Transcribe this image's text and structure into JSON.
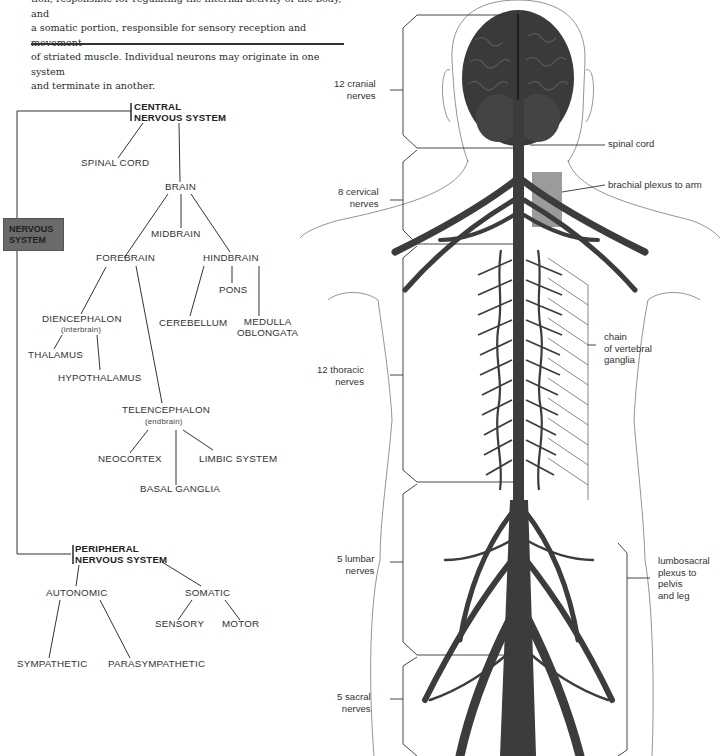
{
  "intro": {
    "lines": [
      "tion, responsible for regulating the internal activity of the body, and",
      "a somatic portion, responsible for sensory reception and movement",
      "of striated muscle. Individual neurons may originate in one system",
      "and terminate in another."
    ]
  },
  "tree": {
    "root": "NERVOUS SYSTEM",
    "root_line1": "NERVOUS",
    "root_line2": "SYSTEM",
    "cns": {
      "line1": "CENTRAL",
      "line2": "NERVOUS SYSTEM"
    },
    "spinal_cord": "SPINAL CORD",
    "brain": "BRAIN",
    "midbrain": "MIDBRAIN",
    "forebrain": "FOREBRAIN",
    "hindbrain": "HINDBRAIN",
    "pons": "PONS",
    "cerebellum": "CEREBELLUM",
    "medulla_line1": "MEDULLA",
    "medulla_line2": "OBLONGATA",
    "diencephalon": "DIENCEPHALON",
    "diencephalon_note": "(interbrain)",
    "thalamus": "THALAMUS",
    "hypothalamus": "HYPOTHALAMUS",
    "telencephalon": "TELENCEPHALON",
    "telencephalon_note": "(endbrain)",
    "neocortex": "NEOCORTEX",
    "limbic": "LIMBIC SYSTEM",
    "basal_ganglia": "BASAL GANGLIA",
    "pns": {
      "line1": "PERIPHERAL",
      "line2": "NERVOUS SYSTEM"
    },
    "autonomic": "AUTONOMIC",
    "somatic": "SOMATIC",
    "sensory": "SENSORY",
    "motor": "MOTOR",
    "sympathetic": "SYMPATHETIC",
    "parasympathetic": "PARASYMPATHETIC"
  },
  "figure": {
    "labels": {
      "cranial_1": "12 cranial",
      "cranial_2": "nerves",
      "spinal_cord": "spinal cord",
      "brachial": "brachial plexus to arm",
      "cervical_1": "8 cervical",
      "cervical_2": "nerves",
      "chain_1": "chain",
      "chain_2": "of vertebral",
      "chain_3": "ganglia",
      "thoracic_1": "12 thoracic",
      "thoracic_2": "nerves",
      "lumbar_1": "5 lumbar",
      "lumbar_2": "nerves",
      "lumbo_1": "lumbosacral",
      "lumbo_2": "plexus to",
      "lumbo_3": "pelvis",
      "lumbo_4": "and leg",
      "sacral_1": "5 sacral",
      "sacral_2": "nerves"
    }
  },
  "colors": {
    "nerve": "#3c3c3c",
    "brain": "#333333",
    "box": "#6a6a6a",
    "highlight": "#7a7a7a",
    "line": "#333333"
  }
}
